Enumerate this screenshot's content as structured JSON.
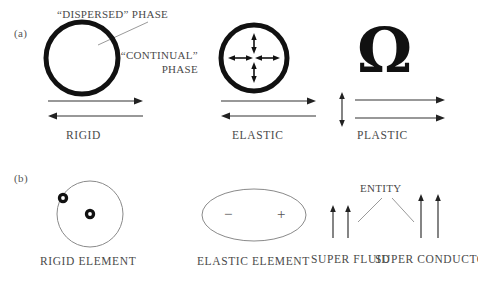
{
  "figure": {
    "background": "#ffffff",
    "ink_dark": "#111111",
    "ink_text": "#4a4a4a",
    "ink_thin": "#8a8a8a"
  },
  "panels": [
    {
      "tag": "(a)",
      "annotations": [
        {
          "name": "dispersed-phase-label",
          "text": "“DISPERSED” PHASE"
        },
        {
          "name": "continual-phase-label",
          "text": "“CONTINUAL”\nPHASE"
        }
      ],
      "items": [
        {
          "name": "rigid",
          "caption": "RIGID",
          "glyph": "thick-circle",
          "arrows": "opposing-horizontal"
        },
        {
          "name": "elastic",
          "caption": "ELASTIC",
          "glyph": "thick-circle-with-cross-arrows",
          "arrows": "opposing-horizontal"
        },
        {
          "name": "plastic",
          "caption": "PLASTIC",
          "glyph": "omega",
          "omega_symbol": "Ω",
          "arrows": "vertical-double-plus-two-right"
        }
      ]
    },
    {
      "tag": "(b)",
      "annotations": [
        {
          "name": "entity-label",
          "text": "ENTITY"
        }
      ],
      "items": [
        {
          "name": "rigid-element",
          "caption": "RIGID ELEMENT",
          "glyph": "thin-circle-two-dots"
        },
        {
          "name": "elastic-element",
          "caption": "ELASTIC ELEMENT",
          "glyph": "thin-ellipse-minus-plus",
          "minus_sign": "−",
          "plus_sign": "+"
        },
        {
          "name": "super-fluid",
          "caption": "SUPER\nFLUID",
          "glyph": "two-short-up-arrows"
        },
        {
          "name": "super-conductor",
          "caption": "SUPER\nCONDUCTOR",
          "glyph": "two-tall-up-arrows"
        }
      ]
    }
  ]
}
